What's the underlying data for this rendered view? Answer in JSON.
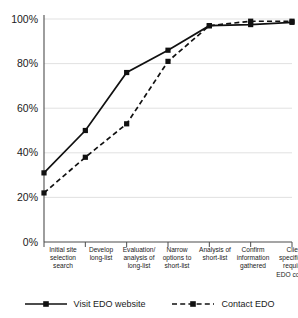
{
  "chart_data": {
    "type": "line",
    "title": "",
    "xlabel": "",
    "ylabel": "",
    "ylim": [
      0,
      100
    ],
    "ytick_labels": [
      "100%",
      "80%",
      "60%",
      "40%",
      "20%",
      "0%"
    ],
    "ytick_values": [
      100,
      80,
      60,
      40,
      20,
      0
    ],
    "grid": true,
    "legend_position": "bottom",
    "categories": [
      "Initial site\nselection\nsearch",
      "Develop\nlong-list",
      "Evaluation/\nanalysis of\nlong-list",
      "Narrow\noptions to\nshort-list",
      "Analysis of\nshort-list",
      "Confirm\ninformation\ngathered",
      "Client\nspecifically\nrequires\nEDO contact"
    ],
    "series": [
      {
        "name": "Visit EDO website",
        "style": "solid",
        "marker": "square",
        "color": "#111111",
        "values": [
          31,
          50,
          76,
          86,
          97,
          97.5,
          98.5
        ]
      },
      {
        "name": "Contact EDO",
        "style": "dashed",
        "marker": "square",
        "color": "#111111",
        "values": [
          22,
          38,
          53,
          81,
          97,
          99,
          99
        ]
      }
    ]
  },
  "legend": {
    "items": [
      {
        "label": "Visit EDO website"
      },
      {
        "label": "Contact EDO"
      }
    ]
  }
}
